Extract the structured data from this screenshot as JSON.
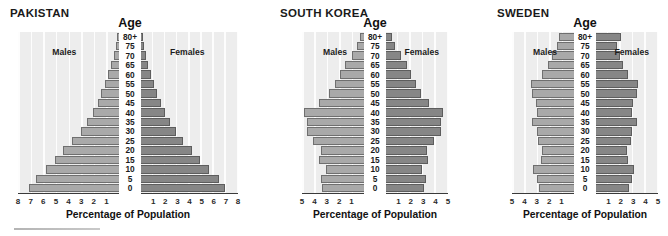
{
  "figure": {
    "axis_title": "Age",
    "x_axis_title": "Percentage of Population",
    "males_label": "Males",
    "females_label": "Females",
    "colors": {
      "males_bar": "#a9a9a9",
      "females_bar": "#868686",
      "plot_background": "#ededed",
      "gridline": "#fdfdfd",
      "text": "#1a1a1a"
    },
    "age_groups": [
      "80+",
      "75",
      "70",
      "65",
      "60",
      "55",
      "50",
      "45",
      "40",
      "35",
      "30",
      "25",
      "20",
      "15",
      "10",
      "5",
      "0"
    ]
  },
  "chart_data": [
    {
      "type": "bar",
      "title": "PAKISTAN",
      "subtype": "population-pyramid",
      "xlabel": "Percentage of Population",
      "ylabel": "Age",
      "categories": [
        "0",
        "5",
        "10",
        "15",
        "20",
        "25",
        "30",
        "35",
        "40",
        "45",
        "50",
        "55",
        "60",
        "65",
        "70",
        "75",
        "80+"
      ],
      "xlim": [
        0,
        8
      ],
      "grid": true,
      "legend_position": "in-plot",
      "left_ticks": [
        "8",
        "7",
        "6",
        "5",
        "4",
        "3",
        "2",
        "1"
      ],
      "right_ticks": [
        "1",
        "2",
        "3",
        "4",
        "5",
        "6",
        "7",
        "8"
      ],
      "series": [
        {
          "name": "Males",
          "values": [
            7.1,
            6.6,
            5.8,
            5.1,
            4.4,
            3.7,
            3.0,
            2.5,
            2.1,
            1.7,
            1.4,
            1.1,
            0.85,
            0.6,
            0.42,
            0.26,
            0.16
          ]
        },
        {
          "name": "Females",
          "values": [
            6.9,
            6.4,
            5.6,
            4.9,
            4.2,
            3.5,
            2.9,
            2.4,
            2.0,
            1.65,
            1.35,
            1.05,
            0.8,
            0.58,
            0.4,
            0.25,
            0.17
          ]
        }
      ]
    },
    {
      "type": "bar",
      "title": "SOUTH KOREA",
      "subtype": "population-pyramid",
      "xlabel": "Percentage of Population",
      "ylabel": "Age",
      "categories": [
        "0",
        "5",
        "10",
        "15",
        "20",
        "25",
        "30",
        "35",
        "40",
        "45",
        "50",
        "55",
        "60",
        "65",
        "70",
        "75",
        "80+"
      ],
      "xlim": [
        0,
        5
      ],
      "grid": true,
      "legend_position": "in-plot",
      "left_ticks": [
        "5",
        "4",
        "3",
        "2",
        "1"
      ],
      "right_ticks": [
        "1",
        "2",
        "3",
        "4",
        "5"
      ],
      "series": [
        {
          "name": "Males",
          "values": [
            3.4,
            3.5,
            3.1,
            3.6,
            3.5,
            4.1,
            4.6,
            4.6,
            4.8,
            3.6,
            2.8,
            2.3,
            1.9,
            1.5,
            1.0,
            0.55,
            0.3
          ]
        },
        {
          "name": "Females",
          "values": [
            3.1,
            3.2,
            2.9,
            3.4,
            3.3,
            3.9,
            4.4,
            4.4,
            4.6,
            3.5,
            2.8,
            2.4,
            2.0,
            1.7,
            1.2,
            0.75,
            0.5
          ]
        }
      ]
    },
    {
      "type": "bar",
      "title": "SWEDEN",
      "subtype": "population-pyramid",
      "xlabel": "Percentage of Population",
      "ylabel": "Age",
      "categories": [
        "0",
        "5",
        "10",
        "15",
        "20",
        "25",
        "30",
        "35",
        "40",
        "45",
        "50",
        "55",
        "60",
        "65",
        "70",
        "75",
        "80+"
      ],
      "xlim": [
        0,
        5
      ],
      "grid": true,
      "legend_position": "in-plot",
      "left_ticks": [
        "5",
        "4",
        "3",
        "2",
        "1"
      ],
      "right_ticks": [
        "1",
        "2",
        "3",
        "4",
        "5"
      ],
      "series": [
        {
          "name": "Males",
          "values": [
            2.8,
            3.0,
            3.3,
            2.7,
            2.6,
            2.9,
            3.0,
            3.4,
            3.0,
            3.1,
            3.4,
            3.5,
            2.6,
            2.1,
            1.8,
            1.4,
            1.2
          ]
        },
        {
          "name": "Females",
          "values": [
            2.7,
            2.9,
            3.1,
            2.6,
            2.5,
            2.8,
            2.9,
            3.3,
            2.9,
            3.0,
            3.3,
            3.4,
            2.6,
            2.2,
            1.9,
            1.7,
            2.0
          ]
        }
      ]
    }
  ],
  "footer": {
    "rule_present": "true"
  }
}
